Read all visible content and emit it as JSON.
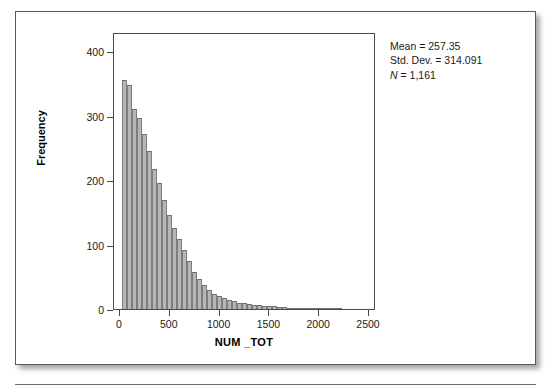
{
  "figure": {
    "stats": {
      "mean_label": "Mean = 257.35",
      "stddev_label": "Std. Dev. = 314.091",
      "n_prefix": "N",
      "n_label": " = 1,161"
    }
  },
  "chart_data": {
    "type": "bar",
    "subtype": "histogram",
    "title": "",
    "xlabel": "NUM _TOT",
    "ylabel": "Frequency",
    "xlim": [
      -60,
      2570
    ],
    "ylim": [
      0,
      430
    ],
    "xticks": [
      0,
      500,
      1000,
      1500,
      2000,
      2500
    ],
    "xtick_labels": [
      "0",
      "500",
      "1000",
      "1500",
      "2000",
      "2500"
    ],
    "yticks": [
      0,
      100,
      200,
      300,
      400
    ],
    "ytick_labels": [
      "0",
      "100",
      "200",
      "300",
      "400"
    ],
    "grid": false,
    "legend": false,
    "bin_width": 50,
    "bar_color": "#b6b6b6",
    "bar_edge_color": "#7d7d7d",
    "bin_starts": [
      25,
      75,
      125,
      175,
      225,
      275,
      325,
      375,
      425,
      475,
      525,
      575,
      625,
      675,
      725,
      775,
      825,
      875,
      925,
      975,
      1025,
      1075,
      1125,
      1175,
      1225,
      1275,
      1325,
      1375,
      1425,
      1475,
      1525,
      1575,
      1625,
      1675,
      1725,
      1775,
      1825,
      1875,
      1925,
      1975,
      2025,
      2075,
      2125,
      2175
    ],
    "values": [
      356,
      348,
      311,
      296,
      272,
      245,
      218,
      196,
      170,
      146,
      125,
      108,
      92,
      74,
      58,
      46,
      38,
      30,
      24,
      20,
      17,
      14,
      12,
      10,
      9,
      8,
      7,
      6,
      5,
      4,
      4,
      3,
      3,
      2,
      2,
      2,
      1,
      1,
      1,
      1,
      1,
      2,
      1,
      1
    ],
    "statistics": {
      "mean": 257.35,
      "std_dev": 314.091,
      "n": 1161
    }
  }
}
